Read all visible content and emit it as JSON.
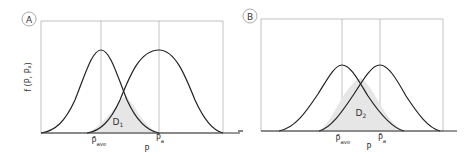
{
  "panels": [
    {
      "id": "A",
      "badge": "A",
      "y_axis_label": "f (P, Pₐ)",
      "x_axis_label": "P",
      "mean_labels": {
        "ave": "P̄",
        "ave_sub": "ave",
        "a": "P̄",
        "a_sub": "a"
      },
      "overlap_label": "D",
      "overlap_sub": "1"
    },
    {
      "id": "B",
      "badge": "B",
      "x_axis_label": "P",
      "mean_labels": {
        "ave": "P̄",
        "ave_sub": "ave",
        "a": "P̄",
        "a_sub": "a"
      },
      "overlap_label": "D",
      "overlap_sub": "2"
    }
  ],
  "colors": {
    "curve": "#222222",
    "overlap_fill": "#e6e6e6",
    "grid": "#9a9a9a"
  }
}
